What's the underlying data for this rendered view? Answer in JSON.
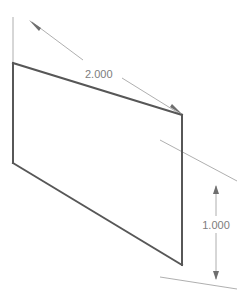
{
  "drawing": {
    "title": "Isometric Rectangular Face with Dimensions",
    "background_color": "#ffffff",
    "units_implied": "inches",
    "model_edge_color": "#5a5a5a",
    "dimension_color": "#8c8c8c",
    "text_color": "#7d7d7d",
    "view": "isometric",
    "shape": {
      "name": "rectangular-face",
      "type": "parallelogram",
      "vertices": {
        "top_left": [
          13,
          63
        ],
        "top_right": [
          182,
          115
        ],
        "bottom_right": [
          182,
          265
        ],
        "bottom_left": [
          13,
          163
        ]
      }
    },
    "dimensions": [
      {
        "id": "width-dimension",
        "label": "2.000",
        "value": 2.0,
        "orientation": "aligned-top",
        "leader_from": [
          30,
          21
        ],
        "leader_to": [
          182,
          115
        ],
        "text_position": [
          85,
          74
        ],
        "arrow_start": [
          30,
          21
        ],
        "arrow_end": [
          182,
          115
        ],
        "extension_line_start": [
          13,
          18
        ],
        "extension_line_end": [
          13,
          66
        ]
      },
      {
        "id": "height-dimension",
        "label": "1.000",
        "value": 1.0,
        "orientation": "vertical",
        "line_x": 216,
        "arrow_top": [
          216,
          188
        ],
        "arrow_bottom": [
          216,
          277
        ],
        "text_position": [
          216,
          224
        ],
        "extension_line_upper_start": [
          182,
          115
        ],
        "extension_line_upper_end": [
          236,
          182
        ],
        "extension_line_lower_start": [
          182,
          265
        ],
        "extension_line_lower_end": [
          236,
          288
        ]
      }
    ]
  }
}
